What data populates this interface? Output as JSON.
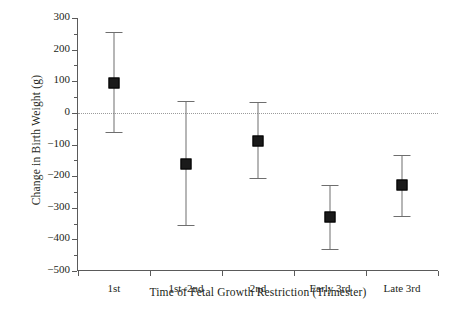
{
  "chart_data": {
    "type": "scatter",
    "title": "",
    "xlabel": "Time of Fetal Growth Restriction (Trimester)",
    "ylabel": "Change in Birth Weight (g)",
    "categories": [
      "1st",
      "1st–2nd",
      "2nd",
      "Early 3rd",
      "Late 3rd"
    ],
    "values": [
      95,
      -163,
      -88,
      -330,
      -228
    ],
    "error_low": [
      -62,
      -355,
      -207,
      -432,
      -325
    ],
    "error_high": [
      255,
      38,
      35,
      -227,
      -132
    ],
    "ylim": [
      -500,
      300
    ],
    "ytick_labels": [
      "300",
      "200",
      "100",
      "0",
      "-100",
      "-200",
      "-300",
      "-400",
      "-500"
    ],
    "ytick_values": [
      300,
      200,
      100,
      0,
      -100,
      -200,
      -300,
      -400,
      -500
    ],
    "yminor_values": [
      250,
      150,
      50,
      -50,
      -150,
      -250,
      -350,
      -450
    ],
    "grid": false,
    "legend": "none",
    "zero_reference_line": 0,
    "marker_style": "filled-square",
    "colors": {
      "marker": "#1a1a1a",
      "errorbar": "#6e6e6e",
      "axis": "#5a5a5a",
      "zeroline": "#9b9b9b",
      "background": "#ffffff",
      "text": "#231f20"
    }
  }
}
